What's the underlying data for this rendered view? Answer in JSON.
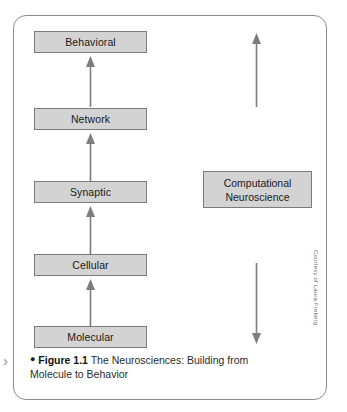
{
  "figure": {
    "levels": [
      {
        "label": "Behavioral"
      },
      {
        "label": "Network"
      },
      {
        "label": "Synaptic"
      },
      {
        "label": "Cellular"
      },
      {
        "label": "Molecular"
      }
    ],
    "side_box": {
      "line1": "Computational",
      "line2": "Neuroscience"
    },
    "arrows": {
      "stack_direction": "up",
      "side_top_direction": "up",
      "side_bottom_direction": "down"
    },
    "colors": {
      "box_fill": "#d3d3d3",
      "box_border": "#7b7b7b",
      "panel_border": "#8d8d8f",
      "arrow": "#7d7d7d",
      "text": "#1a1a1a"
    }
  },
  "caption": {
    "bullet": "●",
    "figure_number": "Figure 1.1",
    "text": "The Neurosciences: Building from Molecule to Behavior",
    "marker": "›"
  },
  "credit": {
    "text": "Courtesy of Laura Freberg"
  }
}
